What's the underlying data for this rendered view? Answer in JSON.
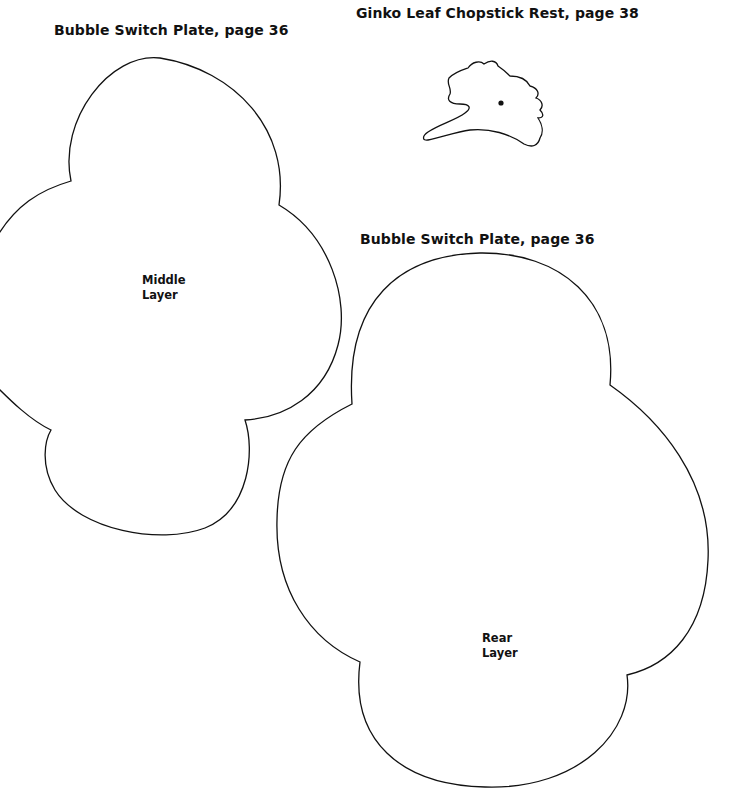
{
  "templates": [
    {
      "id": "middle",
      "title": "Bubble Switch Plate, page 36",
      "layer_label_line1": "Middle",
      "layer_label_line2": "Layer"
    },
    {
      "id": "ginko",
      "title": "Ginko Leaf Chopstick Rest, page 38",
      "marker": "hole-dot"
    },
    {
      "id": "rear",
      "title": "Bubble Switch Plate, page 36",
      "layer_label_line1": "Rear",
      "layer_label_line2": "Layer"
    }
  ],
  "colors": {
    "background": "#ffffff",
    "ink": "#111111"
  }
}
